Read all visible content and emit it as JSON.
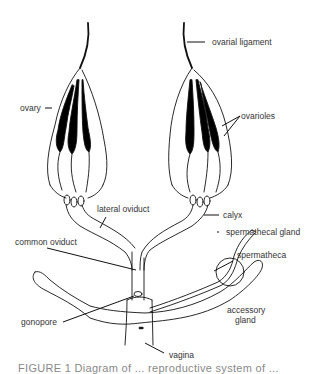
{
  "figure": {
    "type": "anatomical diagram",
    "colors": {
      "line": "#111111",
      "fill_dark": "#000000",
      "background": "#ffffff",
      "text": "#333333"
    }
  },
  "labels": {
    "ovarial_ligament": "ovarial ligament",
    "ovary": "ovary",
    "ovarioles": "ovarioles",
    "lateral_oviduct": "lateral oviduct",
    "calyx": "calyx",
    "spermathecal_gland": "spermathecal gland",
    "common_oviduct": "common oviduct",
    "spermatheca": "spermatheca",
    "gonopore": "gonopore",
    "accessory_gland_line1": "accessory",
    "accessory_gland_line2": "gland",
    "vagina": "vagina"
  },
  "caption": {
    "text": "FIGURE 1  Diagram of ... reproductive system of ..."
  }
}
